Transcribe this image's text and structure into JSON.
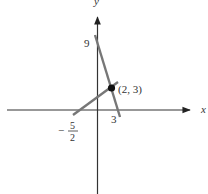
{
  "figure": {
    "axes": {
      "x_label": "x",
      "y_label": "y"
    },
    "lines": [
      {
        "name": "line-through-y-intercept-9",
        "y_intercept_label": "9",
        "x_intercept_label": "3"
      },
      {
        "name": "line-through-x-intercept-neg-5-2",
        "x_intercept_numerator": "5",
        "x_intercept_denominator": "2",
        "x_intercept_sign": "−"
      }
    ],
    "intersection": {
      "label": "(2, 3)"
    },
    "colors": {
      "axis": "#333333",
      "line": "#777777",
      "point": "#111111"
    }
  }
}
